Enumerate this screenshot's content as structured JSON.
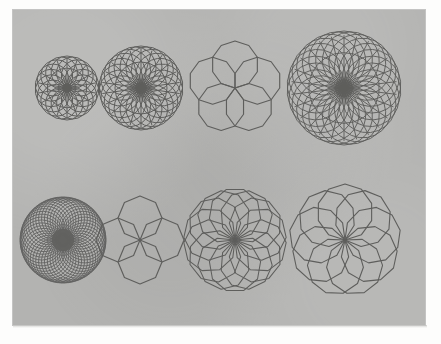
{
  "plate": {
    "background_color": "#fdfdfc",
    "panel_color": "#b3b3b1",
    "ink_color": "#5e5e5c",
    "panel": {
      "x": 13,
      "y": 10,
      "width": 412,
      "height": 315
    }
  },
  "chart_data": {
    "type": "diagram",
    "title": "",
    "rows": 2,
    "columns": 4,
    "figures": [
      {
        "id": "fig-r1c1",
        "label": "rosette-1",
        "row": 1,
        "column": 1,
        "center_x": 67,
        "center_y": 88,
        "radius": 32,
        "polygon_sides": 18,
        "copies": 18,
        "stroke_width": 1.0,
        "density": "dense-radial",
        "render": "spoked-rosette"
      },
      {
        "id": "fig-r1c2",
        "label": "rosette-2",
        "row": 1,
        "column": 2,
        "center_x": 141,
        "center_y": 88,
        "radius": 42,
        "polygon_sides": 20,
        "copies": 22,
        "stroke_width": 1.0,
        "density": "dense-radial",
        "render": "spoked-rosette"
      },
      {
        "id": "fig-r1c3",
        "label": "rosette-3",
        "row": 1,
        "column": 3,
        "center_x": 235,
        "center_y": 88,
        "radius": 47,
        "polygon_sides": 10,
        "copies": 5,
        "stroke_width": 1.15,
        "density": "sparse",
        "render": "polygon-rosette"
      },
      {
        "id": "fig-r1c4",
        "label": "rosette-4",
        "row": 1,
        "column": 4,
        "center_x": 344,
        "center_y": 88,
        "radius": 57,
        "polygon_sides": 22,
        "copies": 26,
        "stroke_width": 0.95,
        "density": "very-dense-radial",
        "render": "spoked-rosette"
      },
      {
        "id": "fig-r2c1",
        "label": "rosette-5",
        "row": 2,
        "column": 1,
        "center_x": 63,
        "center_y": 240,
        "radius": 43,
        "polygon_sides": 30,
        "copies": 46,
        "stroke_width": 0.9,
        "density": "saturated",
        "render": "polygon-rosette"
      },
      {
        "id": "fig-r2c2",
        "label": "rosette-6",
        "row": 2,
        "column": 2,
        "center_x": 140,
        "center_y": 240,
        "radius": 44,
        "polygon_sides": 8,
        "copies": 4,
        "stroke_width": 1.15,
        "density": "sparse",
        "render": "polygon-rosette"
      },
      {
        "id": "fig-r2c3",
        "label": "rosette-7",
        "row": 2,
        "column": 3,
        "center_x": 235,
        "center_y": 240,
        "radius": 52,
        "polygon_sides": 9,
        "copies": 14,
        "stroke_width": 1.05,
        "density": "medium",
        "render": "polygon-rosette"
      },
      {
        "id": "fig-r2c4",
        "label": "rosette-8",
        "row": 2,
        "column": 4,
        "center_x": 345,
        "center_y": 240,
        "radius": 56,
        "polygon_sides": 10,
        "copies": 9,
        "stroke_width": 1.1,
        "density": "medium",
        "render": "polygon-rosette"
      }
    ]
  }
}
